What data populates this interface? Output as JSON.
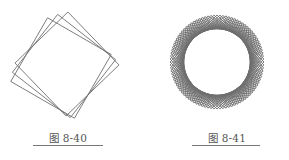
{
  "figures": [
    {
      "caption": "图 8-40",
      "shape": "rotated-squares",
      "square_count": 3,
      "rotation_step_deg": 8,
      "stroke_color": "#6e6e6e"
    },
    {
      "caption": "图 8-41",
      "shape": "rotated-squares-rosette",
      "square_count": 24,
      "rotation_step_deg": 3.75,
      "stroke_color": "#6e6e6e"
    }
  ]
}
